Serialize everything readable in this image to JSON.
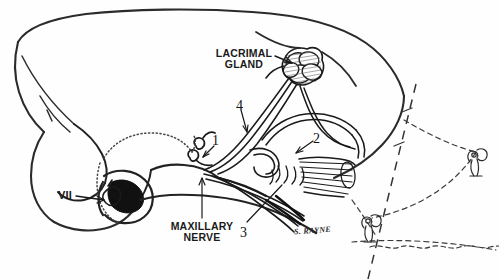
{
  "figure": {
    "background_color": "#fefefe",
    "ink_color": "#1a1a1a",
    "width": 499,
    "height": 279
  },
  "labels": {
    "lacrimal_gland_line1": "LACRIMAL",
    "lacrimal_gland_line2": "GLAND",
    "maxillary_nerve_line1": "MAXILLARY",
    "maxillary_nerve_line2": "NERVE",
    "facial_nerve": "VII"
  },
  "numbered_callouts": [
    {
      "id": "1",
      "text": "1"
    },
    {
      "id": "2",
      "text": "2"
    },
    {
      "id": "3",
      "text": "3"
    },
    {
      "id": "4",
      "text": "4"
    }
  ],
  "signature": {
    "text": "S. RAYNE"
  }
}
